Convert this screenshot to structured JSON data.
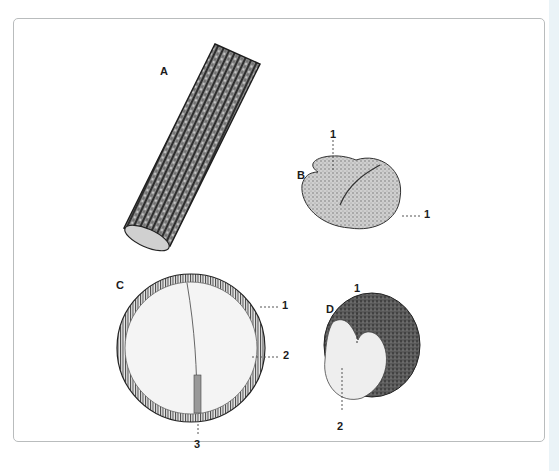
{
  "figure": {
    "panels": [
      {
        "id": "A",
        "label": "A",
        "subject": "cylindrical bark-covered stem section",
        "callouts": []
      },
      {
        "id": "B",
        "label": "B",
        "subject": "rounded lobed seed",
        "callouts": [
          "1",
          "1"
        ]
      },
      {
        "id": "C",
        "label": "C",
        "subject": "circular cross-section with outer ring and central line",
        "callouts": [
          "1",
          "2",
          "3"
        ]
      },
      {
        "id": "D",
        "label": "D",
        "subject": "cut seed showing interior",
        "callouts": [
          "1",
          "2"
        ]
      }
    ],
    "caption_text": "",
    "colors": {
      "frame_border": "#b9bcbd",
      "ink": "#1c1c1c",
      "edge_strip": "#eaf3f7",
      "background": "#ffffff"
    }
  }
}
